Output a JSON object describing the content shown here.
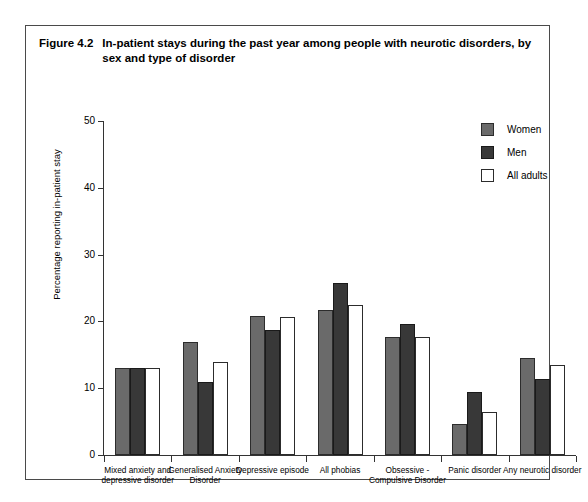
{
  "figure": {
    "number": "Figure 4.2",
    "title": "In-patient stays during the past year among people with neurotic disorders, by sex and type of disorder"
  },
  "legend": {
    "position": "top-right",
    "entries": [
      {
        "label": "Women",
        "color": "#6a6a6a",
        "swatch": "women-swatch"
      },
      {
        "label": "Men",
        "color": "#383838",
        "swatch": "men-swatch"
      },
      {
        "label": "All adults",
        "color": "#ffffff",
        "swatch": "all-adults-swatch"
      }
    ]
  },
  "axes": {
    "y_title": "Percentage reporting in-patient stay",
    "y_ticks": [
      "50",
      "40",
      "30",
      "20",
      "10",
      "0"
    ],
    "x_title": ""
  },
  "chart_data": {
    "type": "bar",
    "title": "In-patient stays during the past year among people with neurotic disorders, by sex and type of disorder",
    "xlabel": "",
    "ylabel": "Percentage reporting in-patient stay",
    "ylim": [
      0,
      50
    ],
    "yticks": [
      0,
      10,
      20,
      30,
      40,
      50
    ],
    "grid": false,
    "legend_position": "top-right",
    "categories": [
      "Mixed anxiety and depressive disorder",
      "Generalised Anxiety Disorder",
      "Depressive episode",
      "All phobias",
      "Obsessive - Compulsive Disorder",
      "Panic disorder",
      "Any neurotic disorder"
    ],
    "series": [
      {
        "name": "Women",
        "color": "#6a6a6a",
        "values": [
          13.1,
          16.9,
          20.8,
          21.7,
          17.7,
          4.6,
          14.5
        ]
      },
      {
        "name": "Men",
        "color": "#383838",
        "values": [
          13.0,
          10.9,
          18.7,
          25.8,
          19.6,
          9.5,
          11.4
        ]
      },
      {
        "name": "All adults",
        "color": "#ffffff",
        "values": [
          13.1,
          13.9,
          20.7,
          22.5,
          17.7,
          6.4,
          13.5
        ]
      }
    ]
  }
}
